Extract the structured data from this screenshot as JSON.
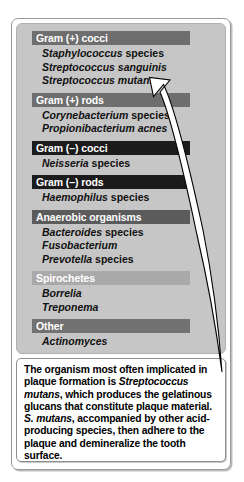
{
  "figure": {
    "panel_background_color": "#c6c6c6",
    "frame_border_color": "#9a9a9a",
    "caption_background_color": "#ffffff"
  },
  "groups": [
    {
      "header": "Gram (+) cocci",
      "header_color": "#6e6e6e",
      "organisms": [
        {
          "genus": "Staphylococcus",
          "rank": " species"
        },
        {
          "genus": "Streptococcus sanguinis",
          "rank": ""
        },
        {
          "genus": "Streptococcus mutans",
          "rank": ""
        }
      ]
    },
    {
      "header": "Gram (+) rods",
      "header_color": "#6e6e6e",
      "organisms": [
        {
          "genus": "Corynebacterium",
          "rank": " species"
        },
        {
          "genus": "Propionibacterium acnes",
          "rank": ""
        }
      ]
    },
    {
      "header": "Gram (–) cocci",
      "header_color": "#1b1b1b",
      "organisms": [
        {
          "genus": "Neisseria",
          "rank": " species"
        }
      ]
    },
    {
      "header": "Gram (–) rods",
      "header_color": "#1b1b1b",
      "organisms": [
        {
          "genus": "Haemophilus",
          "rank": " species"
        }
      ]
    },
    {
      "header": "Anaerobic organisms",
      "header_color": "#5b5b5b",
      "organisms": [
        {
          "genus": "Bacteroides",
          "rank": " species"
        },
        {
          "genus": "Fusobacterium",
          "rank": ""
        },
        {
          "genus": "Prevotella",
          "rank": " species"
        }
      ]
    },
    {
      "header": "Spirochetes",
      "header_color": "#a9a9a9",
      "organisms": [
        {
          "genus": "Borrelia",
          "rank": ""
        },
        {
          "genus": "Treponema",
          "rank": ""
        }
      ]
    },
    {
      "header": "Other",
      "header_color": "#727272",
      "organisms": [
        {
          "genus": "Actinomyces",
          "rank": ""
        }
      ]
    }
  ],
  "caption": {
    "line1_a": "The organism most often implicated in plaque formation is ",
    "line1_italic": "Streptococcus mutans",
    "line1_b": ", which produces the gelatinous glucans that constitute plaque material. ",
    "line2_italic": "S. mutans",
    "line2_b": ", accompanied by other acid-producing species, then adhere to the plaque and demineralize the tooth surface."
  },
  "annotation": {
    "arrow_label": "callout-arrow-to-streptococcus-mutans",
    "arrow_fill": "#ffffff",
    "arrow_outline": "#000000"
  }
}
